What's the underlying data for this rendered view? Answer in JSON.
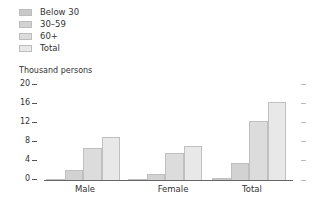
{
  "legend": {
    "items": [
      {
        "label": "Below 30",
        "color": "#c8c8c8"
      },
      {
        "label": "30–59",
        "color": "#d2d2d2"
      },
      {
        "label": "60+",
        "color": "#dcdcdc"
      },
      {
        "label": "Total",
        "color": "#e8e8e8"
      }
    ]
  },
  "axis": {
    "unit_label": "Thousand persons",
    "ticks": [
      "20",
      "16",
      "12",
      "8",
      "4",
      "0"
    ]
  },
  "categories": [
    "Male",
    "Female",
    "Total"
  ],
  "chart_data": {
    "type": "bar",
    "title": "",
    "xlabel": "",
    "ylabel": "Thousand persons",
    "categories": [
      "Male",
      "Female",
      "Total"
    ],
    "series": [
      {
        "name": "Below 30",
        "values": [
          0.2,
          0.2,
          0.4
        ]
      },
      {
        "name": "30–59",
        "values": [
          2.1,
          1.3,
          3.6
        ]
      },
      {
        "name": "60+",
        "values": [
          6.7,
          5.6,
          12.3
        ]
      },
      {
        "name": "Total",
        "values": [
          9.0,
          7.1,
          16.2
        ]
      }
    ],
    "ylim": [
      0,
      20
    ],
    "yticks": [
      0,
      4,
      8,
      12,
      16,
      20
    ],
    "grid": false,
    "legend_position": "top-left"
  }
}
